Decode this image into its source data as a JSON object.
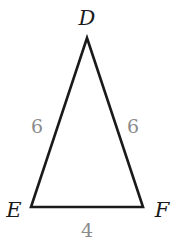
{
  "diagram": {
    "type": "isosceles-triangle",
    "vertices": [
      {
        "id": "D",
        "label": "D",
        "x": 87,
        "y": 38
      },
      {
        "id": "E",
        "label": "E",
        "x": 31,
        "y": 207
      },
      {
        "id": "F",
        "label": "F",
        "x": 143,
        "y": 207
      }
    ],
    "sides": [
      {
        "id": "DE",
        "label": "6"
      },
      {
        "id": "DF",
        "label": "6"
      },
      {
        "id": "EF",
        "label": "4"
      }
    ],
    "colors": {
      "stroke": "#1a1a1a",
      "vertex_label": "#1a1a1a",
      "side_label": "#8a8a8a"
    }
  }
}
